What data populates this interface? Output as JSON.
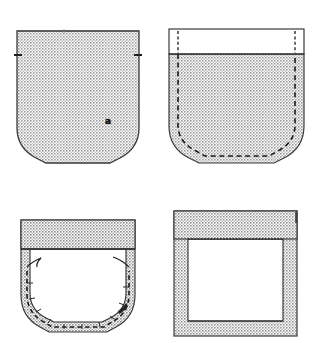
{
  "figure": {
    "kind": "sewing-instruction-diagram",
    "background_color": "#ffffff",
    "fabric_fill_color": "#b0b0b0",
    "fabric_line_color": "#2b2b2b",
    "stitch_line_color": "#1a1a1a",
    "label_color": "#100f0f",
    "panel_count": 4
  },
  "panels": [
    {
      "id": "a",
      "label": "a",
      "title": "pocket piece cut out",
      "description": "Shaded pocket shape with square top, straight sides and a U-shaped curved bottom; small notch marks on left and right edges.",
      "shape": "pocket-blank",
      "fill": "#b0b0b0",
      "features": [
        "notch-left",
        "notch-right",
        "curved-bottom"
      ]
    },
    {
      "id": "b",
      "label": "b",
      "title": "top hem folded, seam allowance marked",
      "description": "Pocket with a white folded hem band across the top and a dashed stitching line running just inside the side and curved bottom edges.",
      "shape": "pocket-with-hem",
      "fill": "#b0b0b0",
      "hem_fill": "#ffffff",
      "features": [
        "white-hem-band",
        "dashed-seam-line",
        "vertical-dashed-fold-lines"
      ]
    },
    {
      "id": "c",
      "label": "c",
      "title": "seam allowance turned under and basted",
      "description": "Pocket seen from the wrong side; white interior with a shaded seam allowance border turned to the inside, dashed basting stitches along the curve and small thread tails at each side.",
      "shape": "pocket-turned",
      "fill": "#b0b0b0",
      "interior_fill": "#ffffff",
      "features": [
        "shaded-top-band",
        "shaded-seam-allowance",
        "dashed-basting-stitches",
        "thread-tail-left",
        "thread-tail-right"
      ]
    },
    {
      "id": "d",
      "label": "d",
      "title": "corners squared and pressed",
      "description": "Square pocket frame with a wide shaded hem band across the top, shaded side and bottom seam allowances and a white centre panel; a dotted stitching line runs under the top band.",
      "shape": "pocket-squared",
      "fill": "#b0b0b0",
      "interior_fill": "#ffffff",
      "features": [
        "wide-top-band",
        "dotted-stitch-line",
        "square-corners"
      ]
    }
  ]
}
